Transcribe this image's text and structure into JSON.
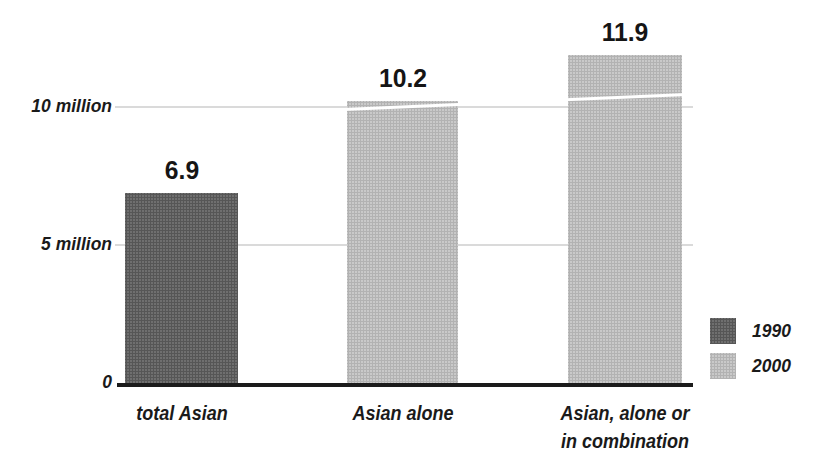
{
  "chart_data": {
    "type": "bar",
    "title": "",
    "unit": "million",
    "categories": [
      "total Asian",
      "Asian alone",
      "Asian, alone or in combination"
    ],
    "bars": [
      {
        "category_lines": [
          "total Asian"
        ],
        "series": "1990",
        "value": 6.9,
        "value_label": "6.9",
        "swatch": "dark"
      },
      {
        "category_lines": [
          "Asian alone"
        ],
        "series": "2000",
        "value": 10.2,
        "value_label": "10.2",
        "swatch": "light"
      },
      {
        "category_lines": [
          "Asian, alone or",
          "in combination"
        ],
        "series": "2000",
        "value": 11.9,
        "value_label": "11.9",
        "swatch": "light"
      }
    ],
    "y_ticks": [
      {
        "value": 0,
        "label": "0"
      },
      {
        "value": 5,
        "label": "5 million"
      },
      {
        "value": 10,
        "label": "10 million"
      }
    ],
    "gridline_values": [
      5,
      10
    ],
    "ylim": [
      0,
      12.7
    ],
    "grid": true,
    "legend_position": "right-bottom",
    "legend": [
      {
        "label": "1990",
        "swatch": "dark"
      },
      {
        "label": "2000",
        "swatch": "light"
      }
    ]
  },
  "colors": {
    "bar_1990": "#6f6f6f",
    "bar_2000": "#c9c9c9",
    "text": "#1a1a1a",
    "gridline": "#dadada",
    "axis_line": "#1b1b1b",
    "background": "#ffffff"
  }
}
